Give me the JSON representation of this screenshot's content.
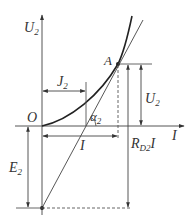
{
  "diagram": {
    "type": "graphical construction of operating point on nonlinear U-I characteristic",
    "colors": {
      "line": "#333333",
      "curve": "#222222",
      "background": "#ffffff"
    },
    "axes": {
      "vertical": {
        "symbol": "U",
        "subscript": "2"
      },
      "horizontal": {
        "symbol": "I",
        "subscript": ""
      },
      "origin": "O"
    },
    "points": {
      "A": "A",
      "origin": "O"
    },
    "labels": {
      "j2": {
        "symbol": "J",
        "subscript": "2"
      },
      "alpha2": {
        "symbol": "α",
        "subscript": "2"
      },
      "current_I": {
        "symbol": "I",
        "subscript": ""
      },
      "e2": {
        "symbol": "E",
        "subscript": "2"
      },
      "u2_right": {
        "symbol": "U",
        "subscript": "2"
      },
      "rd2i": {
        "symbol": "R",
        "subscript": "D2",
        "suffix": "I"
      }
    }
  }
}
